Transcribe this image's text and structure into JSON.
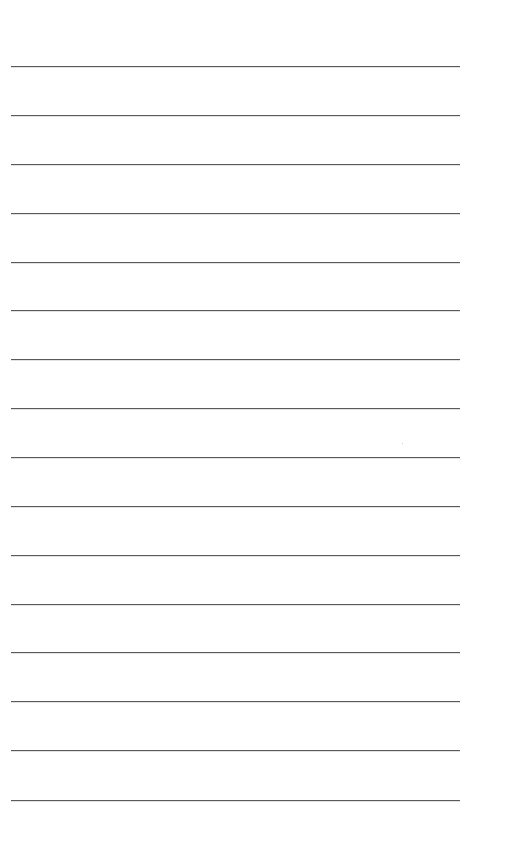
{
  "page": {
    "type": "lined-paper",
    "background_color": "#ffffff",
    "line_color": "#5a5a5a",
    "line_left_px": 11,
    "line_right_px": 460,
    "line_count": 16,
    "line_spacing_px": 49,
    "first_line_y_px": 66,
    "lines": [
      {
        "y": 66,
        "text": ""
      },
      {
        "y": 115,
        "text": ""
      },
      {
        "y": 164,
        "text": ""
      },
      {
        "y": 213,
        "text": ""
      },
      {
        "y": 262,
        "text": ""
      },
      {
        "y": 310,
        "text": ""
      },
      {
        "y": 359,
        "text": ""
      },
      {
        "y": 408,
        "text": ""
      },
      {
        "y": 457,
        "text": ""
      },
      {
        "y": 506,
        "text": ""
      },
      {
        "y": 555,
        "text": ""
      },
      {
        "y": 604,
        "text": ""
      },
      {
        "y": 652,
        "text": ""
      },
      {
        "y": 701,
        "text": ""
      },
      {
        "y": 750,
        "text": ""
      },
      {
        "y": 800,
        "text": ""
      }
    ]
  }
}
